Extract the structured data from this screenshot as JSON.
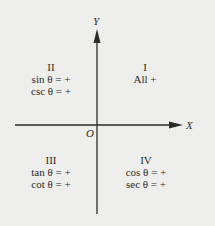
{
  "axes": {
    "x_label": "X",
    "y_label": "Y",
    "origin_label": "O"
  },
  "quadrants": [
    {
      "numeral": "I",
      "lines": [
        "All +"
      ]
    },
    {
      "numeral": "II",
      "lines": [
        "sin θ = +",
        "csc θ = +"
      ]
    },
    {
      "numeral": "III",
      "lines": [
        "tan θ = +",
        "cot θ = +"
      ]
    },
    {
      "numeral": "IV",
      "lines": [
        "cos θ = +",
        "sec θ = +"
      ]
    }
  ],
  "colors": {
    "background": "#eeeeec",
    "ink": "#2b2b2b"
  }
}
